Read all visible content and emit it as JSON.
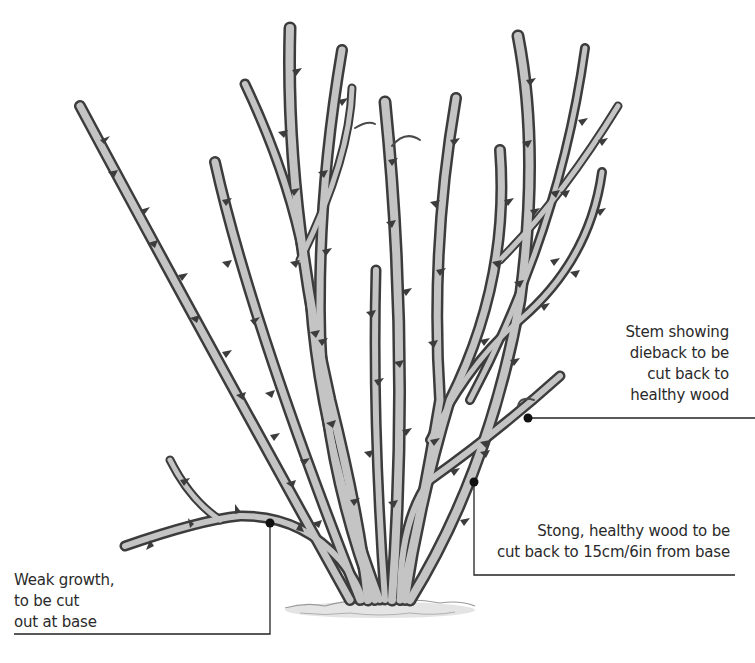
{
  "diagram": {
    "colors": {
      "background": "#ffffff",
      "stem_fill": "#c9c9c9",
      "stem_outline": "#3a3a3a",
      "stem_shade": "#8a8a8a",
      "callout_line": "#222222",
      "callout_dot": "#111111",
      "text": "#2a2a2a"
    },
    "annotations": [
      {
        "id": "dieback",
        "lines": [
          "Stem showing",
          "dieback to be",
          "cut back to",
          "healthy wood"
        ],
        "align": "right",
        "dot": [
          528,
          418
        ]
      },
      {
        "id": "healthy",
        "lines": [
          "Stong, healthy wood to be",
          "cut back to 15cm/6in from base"
        ],
        "align": "right",
        "dot": [
          474,
          482
        ]
      },
      {
        "id": "weak",
        "lines": [
          "Weak growth,",
          "to be cut",
          "out at base"
        ],
        "align": "left",
        "dot": [
          270,
          523
        ]
      }
    ]
  }
}
